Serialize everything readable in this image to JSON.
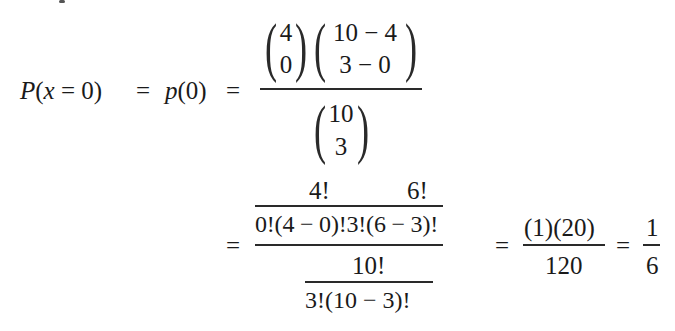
{
  "equation": {
    "lhs": {
      "P": "P",
      "open": "(",
      "x": "x",
      "eq_inner": " = 0)",
      "eq1": "=",
      "p": "p",
      "p_arg": "(0)",
      "eq2": "="
    },
    "step1": {
      "numerator": {
        "binom1": {
          "top": "4",
          "bottom": "0"
        },
        "binom2": {
          "top": "10 − 4",
          "bottom": "3 − 0"
        }
      },
      "denominator": {
        "binom": {
          "top": "10",
          "bottom": "3"
        }
      }
    },
    "step2": {
      "eq": "=",
      "numerator": {
        "top_left": "4!",
        "top_right": "6!",
        "bottom": "0!(4 − 0)!3!(6 − 3)!"
      },
      "denominator": {
        "top": "10!",
        "bottom": "3!(10 − 3)!"
      }
    },
    "step3": {
      "eq": "=",
      "numerator": "(1)(20)",
      "denominator": "120"
    },
    "step4": {
      "eq": "=",
      "numerator": "1",
      "denominator": "6"
    }
  }
}
